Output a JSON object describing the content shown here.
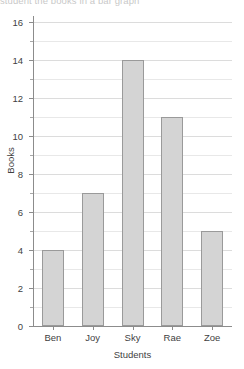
{
  "clipped_top_text": "student the books in a bar graph",
  "chart_data": {
    "type": "bar",
    "title": "",
    "categories": [
      "Ben",
      "Joy",
      "Sky",
      "Rae",
      "Zoe"
    ],
    "values": [
      4,
      7,
      14,
      11,
      5
    ],
    "xlabel": "Students",
    "ylabel": "Books",
    "ylim": [
      0,
      16
    ],
    "ytick_labels": [
      "0",
      "2",
      "4",
      "6",
      "8",
      "10",
      "12",
      "14",
      "16"
    ],
    "ytick_values": [
      0,
      2,
      4,
      6,
      8,
      10,
      12,
      14,
      16
    ],
    "yminor_values": [
      1,
      3,
      5,
      7,
      9,
      11,
      13,
      15
    ],
    "grid": true,
    "legend": false,
    "bar_color": "#d4d4d4",
    "bar_border_color": "#9a9a9a",
    "axis_color": "#8c8c8c",
    "grid_color": "#dcdcdc"
  }
}
